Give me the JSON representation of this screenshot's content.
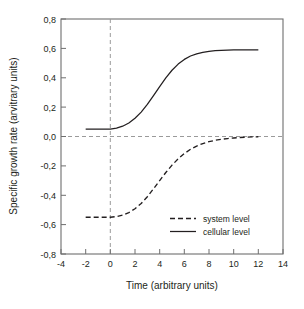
{
  "chart_data": {
    "type": "line",
    "title": "",
    "xlabel": "Time (arbitrary units)",
    "ylabel": "Specific growth rate (arvitrary units)",
    "xlim": [
      -4,
      14
    ],
    "ylim": [
      -0.8,
      0.8
    ],
    "grid": false,
    "legend_position": "inside-bottom-right",
    "xticks": [
      "-4",
      "-2",
      "0",
      "2",
      "4",
      "6",
      "8",
      "10",
      "12",
      "14"
    ],
    "xtick_values": [
      -4,
      -2,
      0,
      2,
      4,
      6,
      8,
      10,
      12,
      14
    ],
    "yticks": [
      "0,8",
      "0,6",
      "0,4",
      "0,2",
      "0,0",
      "-0,2",
      "-0,4",
      "-0,6",
      "-0,8"
    ],
    "ytick_values": [
      0.8,
      0.6,
      0.4,
      0.2,
      0.0,
      -0.2,
      -0.4,
      -0.6,
      -0.8
    ],
    "annotations": [
      {
        "name": "zero-horizontal-reference",
        "type": "hline",
        "value": 0.0,
        "style": "dashed"
      },
      {
        "name": "time-zero-vertical-reference",
        "type": "vline",
        "value": 0.0,
        "style": "dashed"
      }
    ],
    "series": [
      {
        "name": "system level",
        "style": "dashed",
        "color": "#231f20",
        "x": [
          -2.0,
          -1.5,
          -1.0,
          -0.5,
          0.0,
          0.5,
          1.0,
          1.5,
          2.0,
          2.5,
          3.0,
          3.5,
          4.0,
          4.5,
          5.0,
          5.5,
          6.0,
          6.5,
          7.0,
          7.5,
          8.0,
          8.5,
          9.0,
          9.5,
          10.0,
          10.5,
          11.0,
          11.5,
          12.0
        ],
        "values": [
          -0.55,
          -0.55,
          -0.55,
          -0.55,
          -0.55,
          -0.545,
          -0.535,
          -0.518,
          -0.492,
          -0.456,
          -0.41,
          -0.356,
          -0.3,
          -0.245,
          -0.195,
          -0.152,
          -0.116,
          -0.087,
          -0.065,
          -0.048,
          -0.035,
          -0.026,
          -0.019,
          -0.014,
          -0.01,
          -0.007,
          -0.005,
          -0.003,
          -0.002
        ]
      },
      {
        "name": "cellular level",
        "style": "solid",
        "color": "#231f20",
        "x": [
          -2.0,
          -1.5,
          -1.0,
          -0.5,
          0.0,
          0.5,
          1.0,
          1.5,
          2.0,
          2.5,
          3.0,
          3.5,
          4.0,
          4.5,
          5.0,
          5.5,
          6.0,
          6.5,
          7.0,
          7.5,
          8.0,
          8.5,
          9.0,
          9.5,
          10.0,
          10.5,
          11.0,
          11.5,
          12.0
        ],
        "values": [
          0.05,
          0.05,
          0.05,
          0.05,
          0.05,
          0.057,
          0.07,
          0.092,
          0.124,
          0.166,
          0.218,
          0.278,
          0.34,
          0.399,
          0.451,
          0.493,
          0.525,
          0.548,
          0.563,
          0.573,
          0.58,
          0.584,
          0.587,
          0.588,
          0.589,
          0.59,
          0.59,
          0.59,
          0.59
        ]
      }
    ]
  },
  "legend": {
    "entries": [
      {
        "label": "system level",
        "style": "dashed"
      },
      {
        "label": "cellular level",
        "style": "solid"
      }
    ]
  }
}
